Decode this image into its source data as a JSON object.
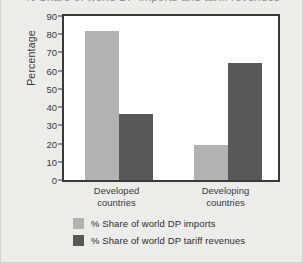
{
  "figure": {
    "background_color": "#ececeb",
    "plot_background_color": "#ffffff",
    "frame_color": "#3a3a3a"
  },
  "chart_data": {
    "type": "bar",
    "title": "% Share of world DP imports and tariff revenues",
    "xlabel": "",
    "ylabel": "Percentage",
    "ylim": [
      0,
      90
    ],
    "yticks": [
      0,
      10,
      20,
      30,
      40,
      50,
      60,
      70,
      80,
      90
    ],
    "grid": false,
    "legend_position": "bottom-left",
    "categories": [
      "Developed countries",
      "Developing countries"
    ],
    "category_lines": [
      [
        "Developed",
        "countries"
      ],
      [
        "Developing",
        "countries"
      ]
    ],
    "series": [
      {
        "name": "% Share of world DP imports",
        "color": "#b2b2b2",
        "values": [
          82,
          19
        ]
      },
      {
        "name": "% Share of world DP tariff revenues",
        "color": "#585858",
        "values": [
          36,
          64
        ]
      }
    ]
  }
}
